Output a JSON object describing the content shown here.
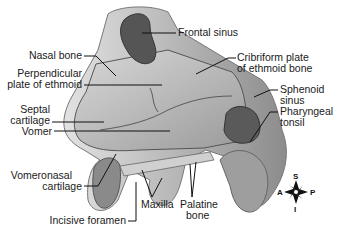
{
  "diagram": {
    "labels": {
      "frontal_sinus": "Frontal sinus",
      "nasal_bone": "Nasal bone",
      "cribriform_plate_1": "Cribriform plate",
      "cribriform_plate_2": "of ethmoid bone",
      "perpendicular_plate_1": "Perpendicular",
      "perpendicular_plate_2": "plate of ethmoid",
      "septal_cartilage_1": "Septal",
      "septal_cartilage_2": "cartilage",
      "sphenoid_sinus_1": "Sphenoid",
      "sphenoid_sinus_2": "sinus",
      "pharyngeal_tonsil_1": "Pharyngeal",
      "pharyngeal_tonsil_2": "tonsil",
      "vomer": "Vomer",
      "vomeronasal_cartilage_1": "Vomeronasal",
      "vomeronasal_cartilage_2": "cartilage",
      "maxilla": "Maxilla",
      "palatine_bone_1": "Palatine",
      "palatine_bone_2": "bone",
      "incisive_foramen": "Incisive foramen"
    },
    "compass": {
      "superior": "S",
      "inferior": "I",
      "anterior": "A",
      "posterior": "P"
    },
    "colors": {
      "bone": "#c9c9c9",
      "cavity": "#b0b0b0",
      "sinus": "#5a5a5a",
      "leader": "#111111"
    }
  }
}
